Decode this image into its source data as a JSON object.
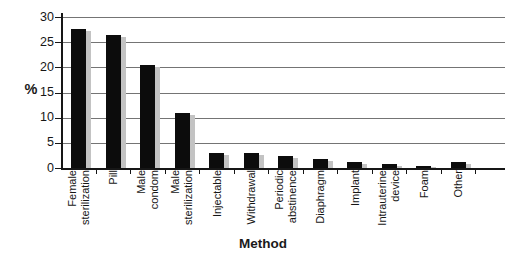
{
  "chart_data": {
    "type": "bar",
    "title": "",
    "xlabel": "Method",
    "ylabel": "%",
    "ylim": [
      0,
      30
    ],
    "yticks": [
      0,
      5,
      10,
      15,
      20,
      25,
      30
    ],
    "grid": true,
    "legend": false,
    "colors": {
      "bar": "#0c0c0c",
      "bar_shadow": "#c3c3c3",
      "gridline": "#747474",
      "axis": "#161616",
      "background": "#ffffff"
    },
    "categories": [
      "Female sterilization",
      "Pill",
      "Male condom",
      "Male sterilization",
      "Injectable",
      "Withdrawal",
      "Periodic abstinence",
      "Diaphragm",
      "Implant",
      "Intrauterine device",
      "Foam",
      "Other"
    ],
    "category_label_lines": [
      [
        "Female",
        "sterilization"
      ],
      [
        "Pill"
      ],
      [
        "Male",
        "condom"
      ],
      [
        "Male",
        "sterilization"
      ],
      [
        "Injectable"
      ],
      [
        "Withdrawal"
      ],
      [
        "Periodic",
        "abstinence"
      ],
      [
        "Diaphragm"
      ],
      [
        "Implant"
      ],
      [
        "Intrauterine",
        "device"
      ],
      [
        "Foam"
      ],
      [
        "Other"
      ]
    ],
    "values": [
      27.7,
      26.4,
      20.4,
      10.9,
      3.0,
      2.9,
      2.3,
      1.8,
      1.2,
      0.8,
      0.4,
      1.1
    ]
  }
}
